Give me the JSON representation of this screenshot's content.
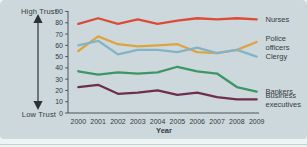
{
  "figure": {
    "axis_left": {
      "high_label": "High Trust",
      "low_label": "Low Trust"
    }
  },
  "chart_data": {
    "type": "line",
    "title": "",
    "xlabel": "Year",
    "ylabel": "",
    "ylim": [
      0,
      90
    ],
    "yticks": [
      0,
      10,
      20,
      30,
      40,
      50,
      60,
      70,
      80,
      90
    ],
    "categories": [
      "2000",
      "2001",
      "2002",
      "2003",
      "2004",
      "2005",
      "2006",
      "2007",
      "2008",
      "2009"
    ],
    "grid": false,
    "legend_position": "right-of-line-ends",
    "series": [
      {
        "name": "Nurses",
        "label_lines": [
          "Nurses"
        ],
        "color": "#dc4b38",
        "values": [
          79,
          84,
          79,
          83,
          79,
          82,
          84,
          83,
          84,
          83
        ]
      },
      {
        "name": "Police officers",
        "label_lines": [
          "Police",
          "officers"
        ],
        "color": "#dda440",
        "values": [
          55,
          68,
          61,
          59,
          60,
          61,
          54,
          53,
          56,
          63
        ]
      },
      {
        "name": "Clergy",
        "label_lines": [
          "Clergy"
        ],
        "color": "#82b4c8",
        "values": [
          60,
          64,
          52,
          56,
          56,
          54,
          58,
          53,
          56,
          50
        ]
      },
      {
        "name": "Bankers",
        "label_lines": [
          "Bankers"
        ],
        "color": "#3e9566",
        "values": [
          37,
          34,
          36,
          35,
          36,
          41,
          37,
          35,
          23,
          19
        ]
      },
      {
        "name": "Business executives",
        "label_lines": [
          "Business",
          "executives"
        ],
        "color": "#6f2d50",
        "values": [
          23,
          25,
          17,
          18,
          20,
          16,
          18,
          14,
          12,
          12
        ]
      }
    ],
    "colors": {
      "background": "#cdd8dd",
      "text": "#333b40",
      "axis": "#4a545a"
    }
  }
}
